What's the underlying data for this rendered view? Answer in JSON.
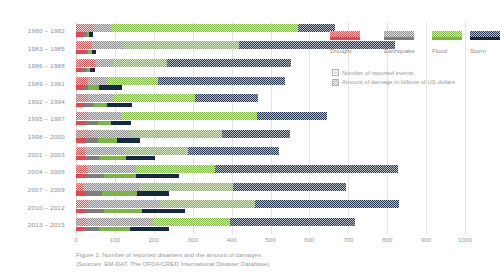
{
  "caption": {
    "line1": "Figure 1: Number of reported disasters and the amount of damages",
    "line2": "(Sources: EM-DAT, The OFDA/CRED International Disaster Database)"
  },
  "legend": {
    "categories": [
      {
        "name": "Drought",
        "color": "#e2474e",
        "key": "drought"
      },
      {
        "name": "Earthquake",
        "color": "#7d7d7d",
        "key": "earthquake"
      },
      {
        "name": "Flood",
        "color": "#7ab547",
        "key": "flood"
      },
      {
        "name": "Storm",
        "color": "#162944",
        "key": "storm"
      }
    ],
    "notes": [
      {
        "label": "Number of reported events",
        "style": "hollow"
      },
      {
        "label": "Amount of damage in billions of US dollars",
        "style": "filled"
      }
    ]
  },
  "chart_data": {
    "type": "bar",
    "orientation": "horizontal",
    "stacked": true,
    "title": "",
    "xlabel": "",
    "ylabel": "",
    "xlim": [
      0,
      1000
    ],
    "xticks": [
      0,
      100,
      200,
      300,
      400,
      500,
      600,
      700,
      800,
      900,
      1000
    ],
    "grid": true,
    "legend_position": "top-right",
    "categories": [
      "1980 – 1982",
      "1983 – 1985",
      "1986 – 1988",
      "1989 – 1991",
      "1992 – 1994",
      "1995 – 1997",
      "1998 – 2000",
      "2001 – 2003",
      "2004 – 2006",
      "2007 – 2009",
      "2010 – 2012",
      "2013 – 2015"
    ],
    "measures": [
      {
        "key": "damage",
        "label": "Amount of damage in billions of US dollars",
        "fill": "hatched"
      },
      {
        "key": "events",
        "label": "Number of reported events",
        "fill": "solid"
      }
    ],
    "series": [
      {
        "name": "Drought",
        "key": "drought",
        "damage": [
          45,
          42,
          48,
          30,
          30,
          30,
          38,
          22,
          28,
          18,
          30,
          28
        ],
        "events": [
          18,
          22,
          16,
          18,
          20,
          22,
          26,
          24,
          26,
          24,
          24,
          20
        ]
      },
      {
        "name": "Earthquake",
        "key": "earthquake",
        "damage": [
          45,
          78,
          47,
          52,
          65,
          85,
          100,
          105,
          125,
          145,
          185,
          170
        ],
        "events": [
          10,
          8,
          12,
          14,
          26,
          34,
          30,
          36,
          46,
          42,
          48,
          40
        ]
      },
      {
        "name": "Flood",
        "key": "flood",
        "damage": [
          480,
          300,
          140,
          130,
          212,
          350,
          238,
          160,
          205,
          240,
          245,
          198
        ],
        "events": [
          6,
          12,
          8,
          26,
          33,
          35,
          50,
          68,
          82,
          92,
          98,
          78
        ]
      },
      {
        "name": "Storm",
        "key": "storm",
        "damage": [
          95,
          400,
          318,
          325,
          160,
          180,
          175,
          235,
          470,
          290,
          370,
          320
        ],
        "events": [
          10,
          10,
          12,
          60,
          66,
          50,
          58,
          74,
          112,
          82,
          110,
          100
        ]
      }
    ]
  }
}
